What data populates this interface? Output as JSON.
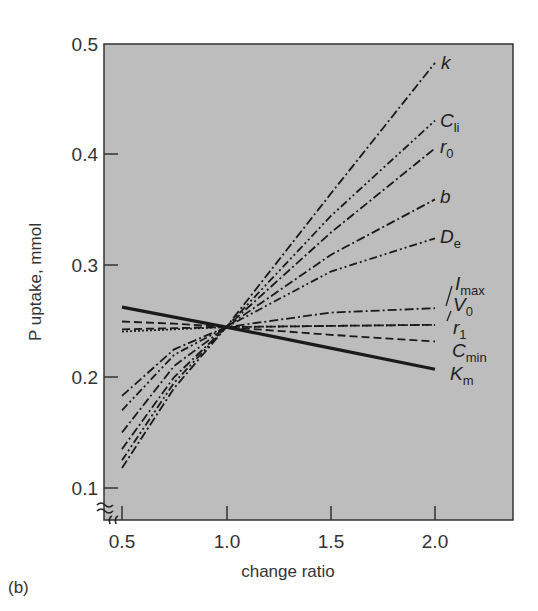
{
  "chart_data": {
    "type": "line",
    "title": "",
    "panel_label": "(b)",
    "xlabel": "change ratio",
    "ylabel": "P uptake, mmol",
    "xlim": [
      0.4,
      2.35
    ],
    "ylim": [
      0.08,
      0.5
    ],
    "x_ticks": [
      "0.5",
      "1.0",
      "1.5",
      "2.0"
    ],
    "y_ticks": [
      "0.1",
      "0.2",
      "0.3",
      "0.4",
      "0.5"
    ],
    "axis_break": "y-axis broken below 0.1 (≈ symbol)",
    "grid": false,
    "background": "#bdbdbd",
    "legend_position": "inline labels at right end of each line",
    "x": [
      0.5,
      0.75,
      1.0,
      1.5,
      2.0
    ],
    "series": [
      {
        "name": "k",
        "style": "dash-dot",
        "values": [
          0.118,
          0.19,
          0.245,
          0.365,
          0.483
        ]
      },
      {
        "name": "C_li",
        "style": "dash-dot-dot",
        "values": [
          0.125,
          0.195,
          0.245,
          0.345,
          0.431
        ]
      },
      {
        "name": "r_0",
        "style": "dash-dot",
        "values": [
          0.135,
          0.2,
          0.245,
          0.33,
          0.406
        ]
      },
      {
        "name": "b",
        "style": "dash-dot",
        "values": [
          0.15,
          0.21,
          0.245,
          0.31,
          0.36
        ]
      },
      {
        "name": "D_e",
        "style": "dash-dot-dot",
        "values": [
          0.17,
          0.22,
          0.245,
          0.295,
          0.325
        ]
      },
      {
        "name": "I_max",
        "style": "dash-dot",
        "values": [
          0.183,
          0.225,
          0.245,
          0.258,
          0.262
        ]
      },
      {
        "name": "V_0",
        "style": "dotted",
        "values": [
          0.241,
          0.243,
          0.245,
          0.246,
          0.247
        ]
      },
      {
        "name": "r_1",
        "style": "dashed",
        "values": [
          0.243,
          0.244,
          0.245,
          0.246,
          0.247
        ]
      },
      {
        "name": "C_min",
        "style": "dashed",
        "values": [
          0.25,
          0.248,
          0.245,
          0.238,
          0.232
        ]
      },
      {
        "name": "K_m",
        "style": "solid-thick",
        "values": [
          0.263,
          0.254,
          0.245,
          0.226,
          0.207
        ]
      }
    ]
  },
  "labels": {
    "k": {
      "main": "k",
      "sub": ""
    },
    "C_li": {
      "main": "C",
      "sub": "li"
    },
    "r_0": {
      "main": "r",
      "sub": "0"
    },
    "b": {
      "main": "b",
      "sub": ""
    },
    "D_e": {
      "main": "D",
      "sub": "e"
    },
    "I_max": {
      "main": "I",
      "sub": "max"
    },
    "V_0": {
      "main": "V",
      "sub": "0"
    },
    "r_1": {
      "main": "r",
      "sub": "1"
    },
    "C_min": {
      "main": "C",
      "sub": "min"
    },
    "K_m": {
      "main": "K",
      "sub": "m"
    }
  }
}
